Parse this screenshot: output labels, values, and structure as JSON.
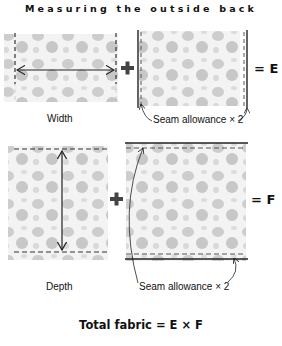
{
  "title": "Measuring the outside back",
  "top_row": {
    "width_label": "Width",
    "plus": "+",
    "seam_label": "Seam allowance × 2",
    "result": "= E"
  },
  "bottom_row": {
    "depth_label": "Depth",
    "plus": "+",
    "seam_label": "Seam allowance × 2",
    "result": "= F"
  },
  "formula": "Total fabric = E × F",
  "colors": {
    "fabric_fill": "#ececec",
    "blob": "#b9b9b9",
    "line": "#222222",
    "plus": "#444444"
  }
}
